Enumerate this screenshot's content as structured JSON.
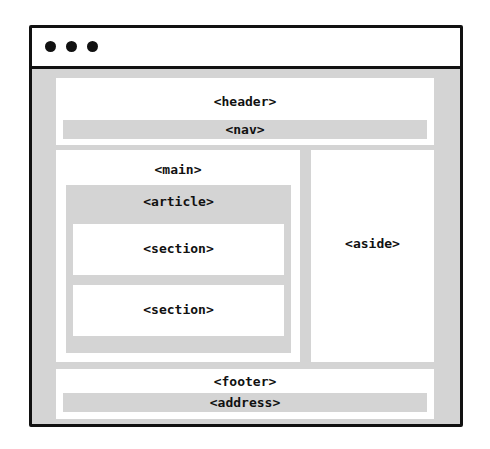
{
  "window": {
    "controls": [
      "dot",
      "dot",
      "dot"
    ]
  },
  "layout": {
    "header": "<header>",
    "nav": "<nav>",
    "main": "<main>",
    "article": "<article>",
    "sections": [
      "<section>",
      "<section>"
    ],
    "aside": "<aside>",
    "footer": "<footer>",
    "address": "<address>"
  },
  "colors": {
    "frame_border": "#111111",
    "container_grey": "#d4d4d4",
    "box_white": "#ffffff"
  }
}
